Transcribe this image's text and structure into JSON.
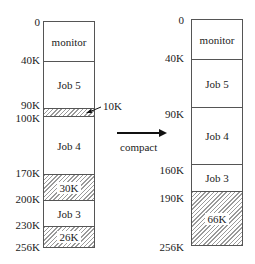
{
  "diagram": {
    "type": "memory-compaction",
    "before": {
      "addresses": [
        "0",
        "40K",
        "90K",
        "100K",
        "170K",
        "200K",
        "230K",
        "256K"
      ],
      "segments": [
        {
          "label": "monitor",
          "start": "0",
          "end": "40K",
          "kind": "allocated"
        },
        {
          "label": "Job 5",
          "start": "40K",
          "end": "90K",
          "kind": "allocated"
        },
        {
          "label": "",
          "start": "90K",
          "end": "100K",
          "kind": "hole"
        },
        {
          "label": "Job 4",
          "start": "100K",
          "end": "170K",
          "kind": "allocated"
        },
        {
          "label": "30K",
          "start": "170K",
          "end": "200K",
          "kind": "hole"
        },
        {
          "label": "Job 3",
          "start": "200K",
          "end": "230K",
          "kind": "allocated"
        },
        {
          "label": "26K",
          "start": "230K",
          "end": "256K",
          "kind": "hole"
        }
      ],
      "callout": "10K"
    },
    "transition": {
      "label": "compact"
    },
    "after": {
      "addresses": [
        "0",
        "40K",
        "90K",
        "160K",
        "190K",
        "256K"
      ],
      "segments": [
        {
          "label": "monitor",
          "start": "0",
          "end": "40K",
          "kind": "allocated"
        },
        {
          "label": "Job 5",
          "start": "40K",
          "end": "90K",
          "kind": "allocated"
        },
        {
          "label": "Job 4",
          "start": "90K",
          "end": "160K",
          "kind": "allocated"
        },
        {
          "label": "Job 3",
          "start": "160K",
          "end": "190K",
          "kind": "allocated"
        },
        {
          "label": "66K",
          "start": "190K",
          "end": "256K",
          "kind": "hole"
        }
      ]
    }
  }
}
